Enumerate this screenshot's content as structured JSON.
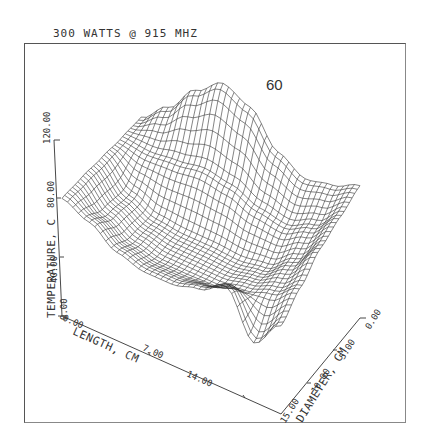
{
  "chart_data": {
    "type": "surface3d",
    "title": "300 WATTS @ 915 MHZ",
    "annotation": "60",
    "xlabel": "LENGTH, CM",
    "ylabel": "DIAMETER, CM",
    "zlabel": "TEMPERATURE, C",
    "x_ticks": [
      "0.00",
      "7.00",
      "14.00"
    ],
    "y_ticks": [
      "15.00",
      "10.00",
      "5.00",
      "0.00"
    ],
    "z_ticks": [
      "0.00",
      "40.00",
      "80.00",
      "120.00"
    ],
    "xlim": [
      0,
      16
    ],
    "ylim": [
      0,
      15
    ],
    "zlim": [
      0,
      120
    ],
    "grid": false,
    "legend": null,
    "surface_samples": {
      "length_cm": [
        0,
        2,
        4,
        6,
        8,
        10,
        12,
        14,
        16
      ],
      "diameter_cm": [
        0,
        3.75,
        7.5,
        11.25,
        15
      ],
      "temperature_c": [
        [
          70,
          85,
          105,
          118,
          110,
          88,
          78,
          82,
          90
        ],
        [
          72,
          70,
          72,
          75,
          72,
          65,
          62,
          70,
          85
        ],
        [
          75,
          58,
          50,
          48,
          48,
          47,
          50,
          62,
          80
        ],
        [
          78,
          62,
          52,
          48,
          48,
          48,
          52,
          58,
          70
        ],
        [
          80,
          72,
          60,
          55,
          55,
          60,
          70,
          40,
          60
        ]
      ]
    }
  },
  "axes": {
    "origin_label": "0.00"
  }
}
